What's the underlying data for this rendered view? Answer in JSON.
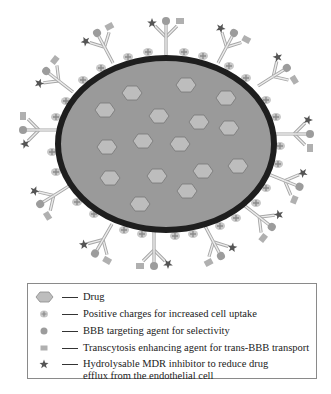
{
  "figure": {
    "type": "nanoparticle-schematic",
    "colors": {
      "particle_fill": "#9a9a9a",
      "particle_border": "#1e1e1e",
      "drug_fill": "#bdbdbd",
      "drug_stroke": "#7a7a7a",
      "antibody_stroke": "#a8a8a8",
      "antibody_fill": "#e2e2e2",
      "charge_fill": "#c4c4c4",
      "charge_plus": "#8a8a8a",
      "targeting_agent": "#9c9c9c",
      "transcytosis_agent": "#b0b0b0",
      "mdr_inhibitor": "#5a5a5a"
    }
  },
  "legend": {
    "items": [
      {
        "symbol": "drug-hexagon",
        "label": "Drug"
      },
      {
        "symbol": "positive-charge",
        "label": "Positive charges for increased cell uptake"
      },
      {
        "symbol": "targeting-circle",
        "label": "BBB targeting agent for selectivity"
      },
      {
        "symbol": "transcytosis-square",
        "label": "Transcytosis enhancing agent for trans-BBB transport"
      },
      {
        "symbol": "mdr-star",
        "label": "Hydrolysable MDR inhibitor to reduce drug",
        "label_line2": "efflux from the endothelial cell"
      }
    ]
  }
}
